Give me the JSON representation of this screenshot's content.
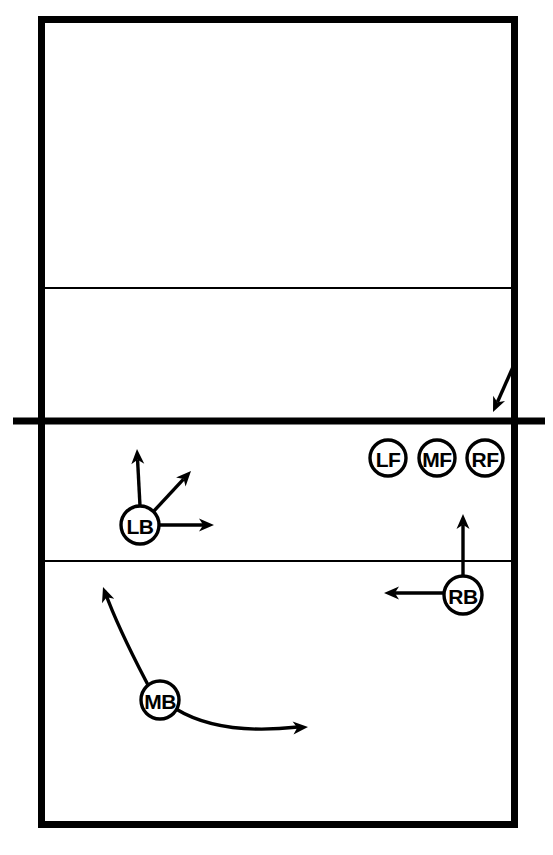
{
  "diagram": {
    "type": "volleyball-court-play-diagram",
    "colors": {
      "line": "#000000",
      "background": "#ffffff",
      "marker_fill": "#ffffff",
      "marker_stroke": "#000000"
    },
    "court": {
      "left": 38,
      "right": 518,
      "top": 16,
      "bottom": 828,
      "boundary_line_width": 7,
      "attack_line_width": 2,
      "net_line_width": 7,
      "net_y": 421,
      "net_left_extent": 13,
      "net_right_extent": 545,
      "far_attack_line_y": 288,
      "near_attack_line_y": 561
    },
    "players": [
      {
        "id": "lf",
        "label": "LF",
        "position_name": "left-front",
        "cx": 388,
        "cy": 458,
        "r": 18
      },
      {
        "id": "mf",
        "label": "MF",
        "position_name": "middle-front",
        "cx": 437,
        "cy": 458,
        "r": 18
      },
      {
        "id": "rf",
        "label": "RF",
        "position_name": "right-front",
        "cx": 485,
        "cy": 458,
        "r": 18
      },
      {
        "id": "lb",
        "label": "LB",
        "position_name": "left-back",
        "cx": 140,
        "cy": 525,
        "r": 19
      },
      {
        "id": "rb",
        "label": "RB",
        "position_name": "right-back",
        "cx": 463,
        "cy": 595,
        "r": 19
      },
      {
        "id": "mb",
        "label": "MB",
        "position_name": "middle-back",
        "cx": 160,
        "cy": 700,
        "r": 19
      }
    ],
    "movement_arrows": [
      {
        "id": "serve-arrow",
        "kind": "straight",
        "description": "incoming serve arrow into far court right corner",
        "x1": 513,
        "y1": 367,
        "x2": 493,
        "y2": 412
      },
      {
        "id": "lb-arrow-up",
        "kind": "straight",
        "description": "LB movement straight toward the net",
        "x1": 140,
        "y1": 506,
        "x2": 137,
        "y2": 449
      },
      {
        "id": "lb-arrow-diagonal",
        "kind": "straight",
        "description": "LB movement diagonally up and to the right",
        "x1": 153,
        "y1": 512,
        "x2": 191,
        "y2": 471
      },
      {
        "id": "lb-arrow-right",
        "kind": "straight",
        "description": "LB movement laterally to the right",
        "x1": 159,
        "y1": 525,
        "x2": 214,
        "y2": 525
      },
      {
        "id": "rb-arrow-up",
        "kind": "straight",
        "description": "RB movement straight toward the net",
        "x1": 463,
        "y1": 576,
        "x2": 463,
        "y2": 514
      },
      {
        "id": "rb-arrow-left",
        "kind": "straight",
        "description": "RB movement laterally to the left",
        "x1": 444,
        "y1": 593,
        "x2": 384,
        "y2": 593
      },
      {
        "id": "mb-curve-up-left",
        "kind": "curved",
        "description": "MB curved movement up and to the left toward the attack line",
        "path": "M 148 685 C 135 660, 118 628, 105 592",
        "tip_x": 103,
        "tip_y": 587,
        "tip_angle_deg": -110
      },
      {
        "id": "mb-curve-right",
        "kind": "curved",
        "description": "MB curved movement to the right along the back court",
        "path": "M 176 709 C 212 731, 262 731, 298 727",
        "tip_x": 308,
        "tip_y": 727,
        "tip_angle_deg": -4
      }
    ]
  }
}
